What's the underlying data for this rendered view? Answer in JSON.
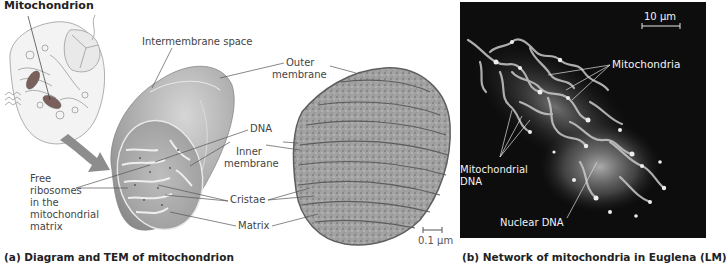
{
  "panel_a": {
    "title": "Mitochondrion",
    "labels": {
      "intermembrane_space": "Intermembrane space",
      "outer_membrane_1": "Outer",
      "outer_membrane_2": "membrane",
      "dna": "DNA",
      "inner_membrane_1": "Inner",
      "inner_membrane_2": "membrane",
      "free_ribosomes_1": "Free",
      "free_ribosomes_2": "ribosomes",
      "free_ribosomes_3": "in the",
      "free_ribosomes_4": "mitochondrial",
      "free_ribosomes_5": "matrix",
      "cristae": "Cristae",
      "matrix": "Matrix"
    },
    "scale_bar": "0.1 µm",
    "caption": "(a) Diagram and TEM of mitochondrion"
  },
  "panel_b": {
    "scale_bar": "10 µm",
    "labels": {
      "mitochondria": "Mitochondria",
      "mito_dna_1": "Mitochondrial",
      "mito_dna_2": "DNA",
      "nuclear_dna": "Nuclear DNA"
    },
    "caption": "(b) Network of mitochondria in Euglena (LM)"
  },
  "colors": {
    "mito_fill": "#a8a8a8",
    "tem_fill": "#9a9a9a",
    "lm_background": "#0d0d0d",
    "lm_signal": "#d8d8d8",
    "arrow": "#8a8a8a"
  }
}
